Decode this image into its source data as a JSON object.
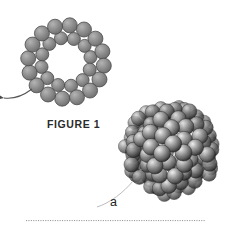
{
  "figure": {
    "caption": "FIGURE 1",
    "part_label": "a",
    "background_color": "#ffffff",
    "schematic": {
      "name": "ring-schematic-diagram",
      "description_visible": false,
      "node_fill_color": "#8d8d8d",
      "node_stroke_color": "#4a4a4a",
      "bond_color": "#6b6b6b",
      "outer_node_count": 16,
      "inner_node_count": 12,
      "center": [
        66,
        62
      ],
      "outer_radius": 38,
      "inner_radius": 25,
      "node_radius_outer": 7.5,
      "node_radius_inner": 6.5,
      "leader_line": {
        "name": "schematic-leader-line",
        "color": "#555555",
        "has_arrowhead": true
      }
    },
    "cluster": {
      "name": "space-filling-cluster",
      "center": [
        171,
        149
      ],
      "radius": 50,
      "sphere_count": 120,
      "base_color": "#5a5a5a",
      "highlight_color": "#d8d8d8",
      "shadow_color": "#1f1f1f",
      "leader_line": {
        "name": "cluster-leader-line",
        "color": "#b9b9b9"
      }
    },
    "separator": {
      "name": "dotted-separator",
      "color": "#9a9a9a",
      "x_start": 26,
      "x_end": 204,
      "y": 220,
      "dot_spacing": 2.4
    }
  }
}
